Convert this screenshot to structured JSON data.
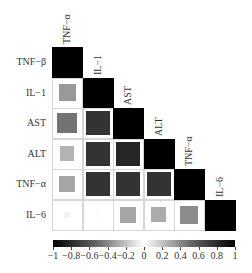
{
  "chart_data": {
    "type": "heatmap",
    "subtype": "lower-triangular correlation matrix (square size ∝ |r|)",
    "title": "",
    "row_labels": [
      "TNF−β",
      "IL−1",
      "AST",
      "ALT",
      "TNF−α",
      "IL−6"
    ],
    "col_labels": [
      "TNF−α",
      "IL−1",
      "AST",
      "ALT",
      "TNF−α",
      "IL−6"
    ],
    "matrix": [
      [
        1.0,
        null,
        null,
        null,
        null,
        null
      ],
      [
        0.4,
        1.0,
        null,
        null,
        null,
        null
      ],
      [
        0.55,
        0.8,
        1.0,
        null,
        null,
        null
      ],
      [
        0.3,
        0.8,
        0.85,
        1.0,
        null,
        null
      ],
      [
        0.35,
        0.8,
        0.8,
        0.8,
        1.0,
        null
      ],
      [
        0.05,
        0.02,
        0.35,
        0.33,
        0.45,
        1.0
      ]
    ],
    "colorbar": {
      "min": -1,
      "max": 1,
      "colormap": "black → white → black (diverging, gray)",
      "ticks": [
        -1,
        -0.8,
        -0.6,
        -0.4,
        -0.2,
        0,
        0.2,
        0.4,
        0.6,
        0.8,
        1
      ],
      "tick_labels": [
        "−1",
        "−0.8",
        "−0.6",
        "−0.4",
        "−0.2",
        "0",
        "0.2",
        "0.4",
        "0.6",
        "0.8",
        "1"
      ],
      "position": "bottom"
    },
    "grid": false,
    "legend_position": "bottom"
  },
  "layout": {
    "grid_left": 52,
    "grid_top": 47,
    "cell_size": 30.5,
    "colorbar_top": 240,
    "colorbar_height": 7,
    "colorbar_left": 53,
    "colorbar_width": 182
  }
}
